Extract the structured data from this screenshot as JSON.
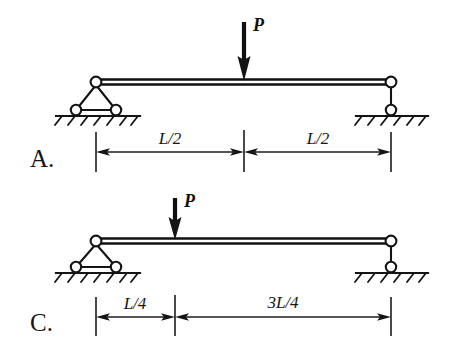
{
  "figure": {
    "kind": "simply-supported-beam-diagrams",
    "background_color": "#ffffff",
    "ink_color": "#151515"
  },
  "diagrams": [
    {
      "option_label": "A.",
      "load": {
        "label": "P",
        "position_fraction": 0.5
      },
      "supports": {
        "left": "pin-on-rollers",
        "right": "link-roller"
      },
      "dimensions": [
        {
          "label": "L/2",
          "span_fraction": 0.5
        },
        {
          "label": "L/2",
          "span_fraction": 0.5
        }
      ]
    },
    {
      "option_label": "C.",
      "load": {
        "label": "P",
        "position_fraction": 0.25
      },
      "supports": {
        "left": "pin-on-rollers",
        "right": "link-roller"
      },
      "dimensions": [
        {
          "label": "L/4",
          "span_fraction": 0.25
        },
        {
          "label": "3L/4",
          "span_fraction": 0.75
        }
      ]
    }
  ]
}
